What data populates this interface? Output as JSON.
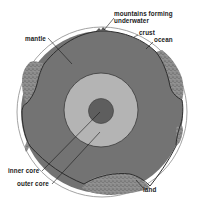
{
  "diagram": {
    "title": "",
    "type": "cross-section of the Earth",
    "colors": {
      "background": "#ffffff",
      "mantle": "#737373",
      "outer_core": "#b4b4b4",
      "inner_core": "#5e5e5e",
      "land": "#8a8a8a",
      "crust_line": "#2e2e2e",
      "ocean_outline": "#8c8c8c"
    },
    "labels": {
      "mountains_line1": "mountains forming",
      "mountains_line2": "underwater",
      "crust": "crust",
      "ocean": "ocean",
      "mantle": "mantle",
      "inner_core": "inner core",
      "outer_core": "outer core",
      "land": "land"
    }
  }
}
